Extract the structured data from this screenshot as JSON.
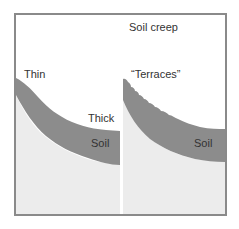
{
  "figure": {
    "title": "Soil creep",
    "left_panel": {
      "top_label": "Thin",
      "mid_label": "Thick",
      "layer_label": "Soil"
    },
    "right_panel": {
      "top_label": "“Terraces”",
      "layer_label": "Soil"
    },
    "colors": {
      "border": "#8a8a8a",
      "soil": "#8c8c8c",
      "bedrock": "#ececec",
      "sky": "#ffffff",
      "divider": "#ffffff",
      "text": "#333333"
    }
  }
}
